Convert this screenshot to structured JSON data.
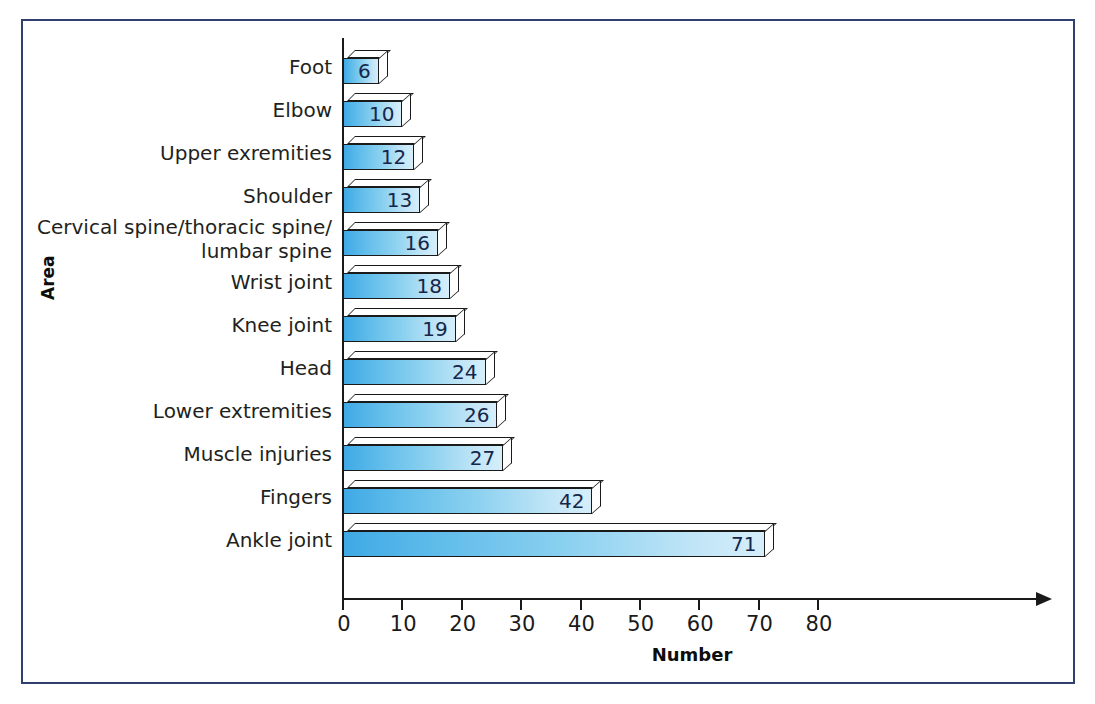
{
  "chart_data": {
    "type": "bar",
    "orientation": "horizontal",
    "title": "",
    "xlabel": "Number",
    "ylabel": "Area",
    "xlim": [
      0,
      80
    ],
    "xticks": [
      0,
      10,
      20,
      30,
      40,
      50,
      60,
      70,
      80
    ],
    "grid": false,
    "legend": null,
    "categories": [
      "Foot",
      "Elbow",
      "Upper exremities",
      "Shoulder",
      "Cervical spine/thoracic spine/\nlumbar spine",
      "Wrist joint",
      "Knee joint",
      "Head",
      "Lower extremities",
      "Muscle injuries",
      "Fingers",
      "Ankle joint"
    ],
    "values": [
      6,
      10,
      12,
      13,
      16,
      18,
      19,
      24,
      26,
      27,
      42,
      71
    ],
    "data_labels": [
      "6",
      "10",
      "12",
      "13",
      "16",
      "18",
      "19",
      "24",
      "26",
      "27",
      "42",
      "71"
    ]
  },
  "style": {
    "frame_color": "#30406e",
    "bar_gradient_start": "#3fa9e5",
    "bar_gradient_end": "#d6eefa",
    "bar_outline": "#1a1a1a",
    "axis_color": "#1a1a1a",
    "label_color": "#231f20",
    "value_color": "#15264a",
    "background": "#ffffff"
  }
}
